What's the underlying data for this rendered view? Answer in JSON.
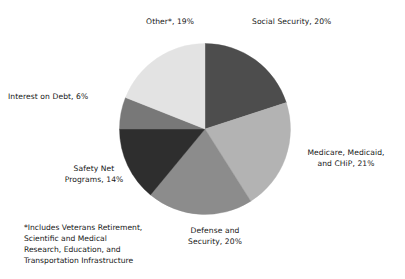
{
  "chart_data": {
    "type": "pie",
    "title": "",
    "categories": [
      "Social Security",
      "Medicare, Medicaid, and CHiP",
      "Defense and Security",
      "Safety Net Programs",
      "Interest on Debt",
      "Other*"
    ],
    "values": [
      20,
      21,
      20,
      14,
      6,
      19
    ],
    "value_unit": "%",
    "start_angle_deg": 0,
    "direction": "clockwise",
    "legend": "none",
    "grid": false,
    "slices": [
      {
        "name": "Social Security",
        "value": 20,
        "label": "Social Security, 20%",
        "color": "#4d4d4d"
      },
      {
        "name": "Medicare, Medicaid, and CHiP",
        "value": 21,
        "label": "Medicare, Medicaid,\nand CHiP, 21%",
        "color": "#b3b3b3"
      },
      {
        "name": "Defense and Security",
        "value": 20,
        "label": "Defense and\nSecurity, 20%",
        "color": "#8c8c8c"
      },
      {
        "name": "Safety Net Programs",
        "value": 14,
        "label": "Safety Net\nPrograms, 14%",
        "color": "#2e2e2e"
      },
      {
        "name": "Interest on Debt",
        "value": 6,
        "label": "Interest on Debt, 6%",
        "color": "#787878"
      },
      {
        "name": "Other*",
        "value": 19,
        "label": "Other*, 19%",
        "color": "#e3e3e3"
      }
    ],
    "annotations": [
      "*Includes Veterans Retirement,\nScientific and Medical\nResearch, Education, and\nTransportation Infrastructure"
    ]
  },
  "labels": {
    "social_security": "Social Security, 20%",
    "medicare": "Medicare, Medicaid,\nand CHiP, 21%",
    "defense": "Defense and\nSecurity, 20%",
    "safety_net": "Safety Net\nPrograms, 14%",
    "interest_on_debt": "Interest on Debt, 6%",
    "other": "Other*, 19%"
  },
  "footnote": "*Includes Veterans Retirement,\nScientific and Medical\nResearch, Education, and\nTransportation Infrastructure"
}
